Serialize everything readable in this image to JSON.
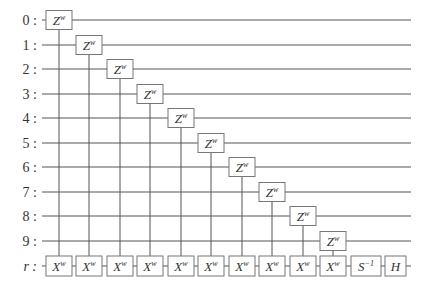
{
  "diagram": {
    "type": "quantum-circuit",
    "colors": {
      "wire": "#555555",
      "box_stroke": "#777777",
      "text": "#333333",
      "background": "#ffffff"
    },
    "wires": [
      {
        "label": "0 :",
        "y": 20
      },
      {
        "label": "1 :",
        "y": 45
      },
      {
        "label": "2 :",
        "y": 69
      },
      {
        "label": "3 :",
        "y": 94
      },
      {
        "label": "4 :",
        "y": 118
      },
      {
        "label": "5 :",
        "y": 143
      },
      {
        "label": "6 :",
        "y": 167
      },
      {
        "label": "7 :",
        "y": 192
      },
      {
        "label": "8 :",
        "y": 216
      },
      {
        "label": "9 :",
        "y": 241
      },
      {
        "label": "r :",
        "y": 266,
        "italic": true
      }
    ],
    "wire_start_x": 42,
    "wire_end_x": 411,
    "columns_x": [
      59,
      89,
      120,
      150,
      181,
      211,
      242,
      272,
      303,
      333
    ],
    "controlled_gates": [
      {
        "column": 0,
        "control_wire": 0,
        "control_gate": "Z",
        "control_sup": "w",
        "target_gate": "X",
        "target_sup": "w"
      },
      {
        "column": 1,
        "control_wire": 1,
        "control_gate": "Z",
        "control_sup": "w",
        "target_gate": "X",
        "target_sup": "w"
      },
      {
        "column": 2,
        "control_wire": 2,
        "control_gate": "Z",
        "control_sup": "w",
        "target_gate": "X",
        "target_sup": "w"
      },
      {
        "column": 3,
        "control_wire": 3,
        "control_gate": "Z",
        "control_sup": "w",
        "target_gate": "X",
        "target_sup": "w"
      },
      {
        "column": 4,
        "control_wire": 4,
        "control_gate": "Z",
        "control_sup": "w",
        "target_gate": "X",
        "target_sup": "w"
      },
      {
        "column": 5,
        "control_wire": 5,
        "control_gate": "Z",
        "control_sup": "w",
        "target_gate": "X",
        "target_sup": "w"
      },
      {
        "column": 6,
        "control_wire": 6,
        "control_gate": "Z",
        "control_sup": "w",
        "target_gate": "X",
        "target_sup": "w"
      },
      {
        "column": 7,
        "control_wire": 7,
        "control_gate": "Z",
        "control_sup": "w",
        "target_gate": "X",
        "target_sup": "w"
      },
      {
        "column": 8,
        "control_wire": 8,
        "control_gate": "Z",
        "control_sup": "w",
        "target_gate": "X",
        "target_sup": "w"
      },
      {
        "column": 9,
        "control_wire": 9,
        "control_gate": "Z",
        "control_sup": "w",
        "target_gate": "X",
        "target_sup": "w"
      }
    ],
    "final_gates": [
      {
        "label": "S",
        "sup": "−1",
        "x": 351,
        "width": 30
      },
      {
        "label": "H",
        "sup": "",
        "x": 385,
        "width": 21
      }
    ]
  }
}
